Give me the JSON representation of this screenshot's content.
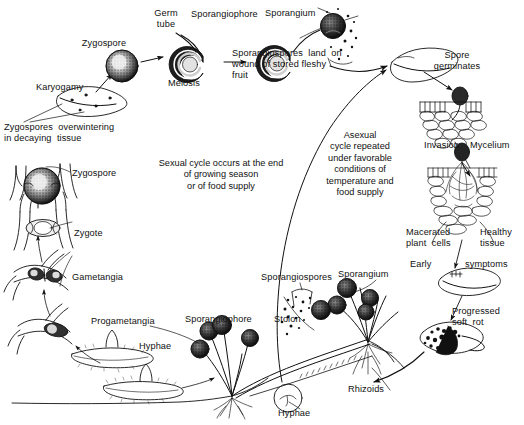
{
  "figure": {
    "background_color": "#ffffff",
    "ink_color": "#111111"
  },
  "labels": {
    "zygospore_top": "Zygospore",
    "karyogamy": "Karyogamy",
    "zygospores_overwintering": "Zygospores  overwintering\nin decaying  tissue",
    "germ_tube": "Germ\ntube",
    "meiosis": "Meiosis",
    "sporangiophore_top": "Sporangiophore",
    "sporangium_top": "Sporangium",
    "sporangiospores_land": "Sporangiospores  land  on\nwound of stored fleshy\nfruit",
    "spore_germinates": "Spore\ngerminates",
    "invasion": "Invasion",
    "mycelium": "Mycelium",
    "macerated_plant_cells": "Macerated\nplant  cells",
    "healthy_tissue": "Healthy\ntissue",
    "early": "Early",
    "symptoms": "symptoms",
    "progressed_soft_rot": "Progressed\nsoft  rot",
    "rhizoids": "Rhizoids",
    "hyphae_bottom": "Hyphae",
    "stolon": "Stolon",
    "sporangium_bottom": "Sporangium",
    "sporangiospores_bottom": "Sporangiospores",
    "sporangiophore_bottom": "Sporangiophore",
    "hyphae_left": "Hyphae",
    "progametangia": "Progametangia",
    "gametangia": "Gametangia",
    "zygote": "Zygote",
    "zygospore_left": "Zygospore",
    "sexual_cycle_note": "Sexual cycle occurs at the end\nof growing  season\nor of food     supply",
    "asexual_cycle_note": "Asexual\ncycle  repeated\nunder  favorable\nconditions    of\ntemperature   and\nfood  supply"
  }
}
